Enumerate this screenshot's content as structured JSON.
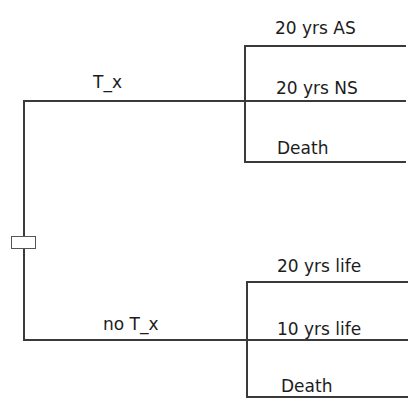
{
  "diagram": {
    "type": "decision-tree",
    "root": {
      "shape": "decision-node-rectangle"
    },
    "branches": [
      {
        "label": "T_x",
        "outcomes": [
          {
            "label": "20 yrs AS"
          },
          {
            "label": "20 yrs NS"
          },
          {
            "label": "Death"
          }
        ]
      },
      {
        "label": "no T_x",
        "outcomes": [
          {
            "label": "20 yrs life"
          },
          {
            "label": "10 yrs life"
          },
          {
            "label": "Death"
          }
        ]
      }
    ],
    "colors": {
      "line": "#3a3a3a",
      "text": "#1c1c1c",
      "background": "#ffffff"
    }
  }
}
